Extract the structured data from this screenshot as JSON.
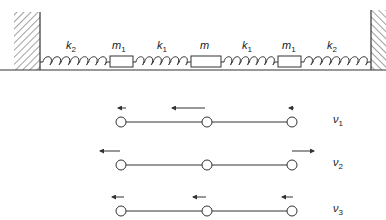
{
  "colors": {
    "ink": "#333333",
    "background": "#ffffff"
  },
  "system": {
    "labels": [
      {
        "id": "k2-left",
        "sym": "k",
        "sub": "2",
        "x": 66,
        "y": 40
      },
      {
        "id": "m1-left",
        "sym": "m",
        "sub": "1",
        "x": 112,
        "y": 40
      },
      {
        "id": "k1-left",
        "sym": "k",
        "sub": "1",
        "x": 157,
        "y": 40
      },
      {
        "id": "m-center",
        "sym": "m",
        "sub": "",
        "x": 200,
        "y": 40
      },
      {
        "id": "k1-right",
        "sym": "k",
        "sub": "1",
        "x": 242,
        "y": 40
      },
      {
        "id": "m1-right",
        "sym": "m",
        "sub": "1",
        "x": 282,
        "y": 40
      },
      {
        "id": "k2-right",
        "sym": "k",
        "sub": "2",
        "x": 327,
        "y": 40
      }
    ],
    "chain": [
      "wall",
      "k2",
      "m1",
      "k1",
      "m",
      "k1",
      "m1",
      "k2",
      "wall"
    ]
  },
  "modes": [
    {
      "label_sym": "ν",
      "label_sub": "1",
      "y": 122,
      "arrows": [
        {
          "x1": 126,
          "x2": 118
        },
        {
          "x1": 205,
          "x2": 172
        },
        {
          "x1": 294,
          "x2": 289
        }
      ]
    },
    {
      "label_sym": "ν",
      "label_sub": "2",
      "y": 165,
      "arrows": [
        {
          "x1": 120,
          "x2": 100
        },
        {
          "x1": 292,
          "x2": 314
        }
      ]
    },
    {
      "label_sym": "ν",
      "label_sub": "3",
      "y": 211,
      "arrows": [
        {
          "x1": 124,
          "x2": 112
        },
        {
          "x1": 206,
          "x2": 193
        },
        {
          "x1": 293,
          "x2": 282
        }
      ]
    }
  ],
  "mode_label_x": 333
}
